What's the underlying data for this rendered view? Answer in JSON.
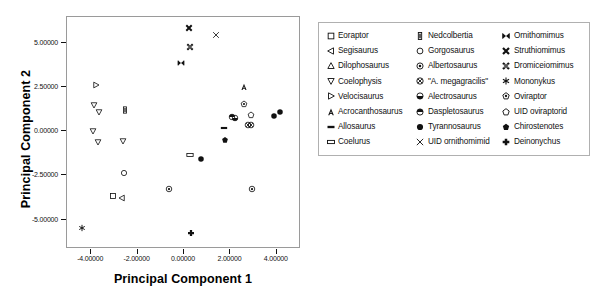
{
  "chart_data": {
    "type": "scatter",
    "title": "",
    "xlabel": "Principal Component 1",
    "ylabel": "Principal Component 2",
    "xlim": [
      -5.0,
      5.0
    ],
    "ylim": [
      -6.6,
      6.4
    ],
    "xticks": [
      "-4.00000",
      "-2.00000",
      "0.00000",
      "2.00000",
      "4.00000"
    ],
    "xtickvals": [
      -4,
      -2,
      0,
      2,
      4
    ],
    "yticks": [
      "5.00000",
      "2.50000",
      "0.00000",
      "-2.50000",
      "-5.00000"
    ],
    "ytickvals": [
      5,
      2.5,
      0,
      -2.5,
      -5
    ],
    "grid": false,
    "legend_position": "right",
    "points": [
      {
        "taxon": "Eoraptor",
        "marker": "square",
        "x": -3.02,
        "y": -3.72
      },
      {
        "taxon": "Segisaurus",
        "marker": "tri-left",
        "x": -2.62,
        "y": -3.82
      },
      {
        "taxon": "Coelophysis",
        "marker": "tri-down",
        "x": -3.85,
        "y": 1.42
      },
      {
        "taxon": "Coelophysis",
        "marker": "tri-down",
        "x": -3.6,
        "y": 1.02
      },
      {
        "taxon": "Coelophysis",
        "marker": "tri-down",
        "x": -3.88,
        "y": -0.05
      },
      {
        "taxon": "Coelophysis",
        "marker": "tri-down",
        "x": -3.66,
        "y": -0.65
      },
      {
        "taxon": "Coelophysis",
        "marker": "tri-down",
        "x": -2.6,
        "y": -0.62
      },
      {
        "taxon": "Velocisaurus",
        "marker": "tri-right",
        "x": -3.77,
        "y": 2.55
      },
      {
        "taxon": "Nedcolbertia",
        "marker": "bar-vert",
        "x": -2.52,
        "y": 1.12
      },
      {
        "taxon": "Gorgosaurus",
        "marker": "circle-open",
        "x": -2.53,
        "y": -2.42
      },
      {
        "taxon": "Mononykus",
        "marker": "asterisk",
        "x": -4.35,
        "y": -5.55
      },
      {
        "taxon": "Albertosaurus",
        "marker": "circle-dot",
        "x": -0.62,
        "y": -3.3
      },
      {
        "taxon": "Albertosaurus",
        "marker": "circle-dot",
        "x": 2.97,
        "y": -3.33
      },
      {
        "taxon": "Ornithomimus",
        "marker": "bowtie",
        "x": -0.1,
        "y": 3.8
      },
      {
        "taxon": "Struthiomimus",
        "marker": "x-bold",
        "x": 0.28,
        "y": 5.78
      },
      {
        "taxon": "Dromiceiomimus",
        "marker": "x-hatch",
        "x": 0.32,
        "y": 4.72
      },
      {
        "taxon": "UID ornithomimid",
        "marker": "x-thin",
        "x": 1.42,
        "y": 5.38
      },
      {
        "taxon": "Coelurus",
        "marker": "bar-open",
        "x": 0.3,
        "y": -1.42
      },
      {
        "taxon": "Tyrannosaurus",
        "marker": "circle-fill",
        "x": 0.78,
        "y": -1.62
      },
      {
        "taxon": "Deinonychus",
        "marker": "plus",
        "x": 0.35,
        "y": -5.82
      },
      {
        "taxon": "Chirostenotes",
        "marker": "pentagon-fill",
        "x": 1.8,
        "y": -0.55
      },
      {
        "taxon": "Allosaurus",
        "marker": "bar-fill",
        "x": 1.78,
        "y": 0.12
      },
      {
        "taxon": "Daspletosaurus",
        "marker": "circle-top",
        "x": 2.1,
        "y": 0.72
      },
      {
        "taxon": "Alectrosaurus",
        "marker": "circle-bottom",
        "x": 2.24,
        "y": 0.68
      },
      {
        "taxon": "Acrocanthosaurus",
        "marker": "letter-a",
        "x": 2.62,
        "y": 2.45
      },
      {
        "taxon": "Oviraptor",
        "marker": "pentagon-dot",
        "x": 2.63,
        "y": 1.48
      },
      {
        "taxon": "UID oviraptorid",
        "marker": "pentagon-open",
        "x": 2.93,
        "y": 0.85
      },
      {
        "taxon": "\"A. megagracilis\"",
        "marker": "circle-x",
        "x": 2.8,
        "y": 0.28
      },
      {
        "taxon": "\"A. megagracilis\"",
        "marker": "circle-x",
        "x": 2.95,
        "y": 0.3
      },
      {
        "taxon": "Tyrannosaurus",
        "marker": "circle-fill",
        "x": 3.92,
        "y": 0.78
      },
      {
        "taxon": "Tyrannosaurus",
        "marker": "circle-fill",
        "x": 4.18,
        "y": 1.02
      }
    ]
  },
  "legend": {
    "columns": [
      [
        {
          "label": "Eoraptor",
          "marker": "square"
        },
        {
          "label": "Segisaurus",
          "marker": "tri-left"
        },
        {
          "label": "Dilophosaurus",
          "marker": "tri-up"
        },
        {
          "label": "Coelophysis",
          "marker": "tri-down"
        },
        {
          "label": "Velocisaurus",
          "marker": "tri-right"
        },
        {
          "label": "Acrocanthosaurus",
          "marker": "letter-a"
        },
        {
          "label": "Allosaurus",
          "marker": "bar-fill"
        },
        {
          "label": "Coelurus",
          "marker": "bar-open"
        }
      ],
      [
        {
          "label": "Nedcolbertia",
          "marker": "bar-vert"
        },
        {
          "label": "Gorgosaurus",
          "marker": "circle-open"
        },
        {
          "label": "Albertosaurus",
          "marker": "circle-dot"
        },
        {
          "label": "\"A. megagracilis\"",
          "marker": "circle-x"
        },
        {
          "label": "Alectrosaurus",
          "marker": "circle-bottom"
        },
        {
          "label": "Daspletosaurus",
          "marker": "circle-top"
        },
        {
          "label": "Tyrannosaurus",
          "marker": "circle-fill"
        },
        {
          "label": "UID ornithomimid",
          "marker": "x-thin"
        }
      ],
      [
        {
          "label": "Ornithomimus",
          "marker": "bowtie"
        },
        {
          "label": "Struthiomimus",
          "marker": "x-bold"
        },
        {
          "label": "Dromiceiomimus",
          "marker": "x-hatch"
        },
        {
          "label": "Mononykus",
          "marker": "asterisk"
        },
        {
          "label": "Oviraptor",
          "marker": "pentagon-dot"
        },
        {
          "label": "UID oviraptorid",
          "marker": "pentagon-open"
        },
        {
          "label": "Chirostenotes",
          "marker": "pentagon-fill"
        },
        {
          "label": "Deinonychus",
          "marker": "plus"
        }
      ]
    ]
  },
  "colors": {
    "ink": "#111111",
    "frame": "#9a9a9a",
    "background": "#ffffff"
  }
}
